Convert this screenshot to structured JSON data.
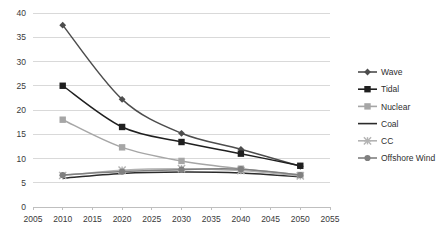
{
  "chart_data": {
    "type": "line",
    "title": "",
    "subtitle": "",
    "xlabel": "",
    "ylabel": "",
    "x": [
      2010,
      2020,
      2030,
      2040,
      2050
    ],
    "xlim": [
      2005,
      2055
    ],
    "ylim": [
      0,
      40
    ],
    "xticks": [
      "2005",
      "2010",
      "2015",
      "2020",
      "2025",
      "2030",
      "2035",
      "2040",
      "2045",
      "2050",
      "2055"
    ],
    "xtick_values": [
      2005,
      2010,
      2015,
      2020,
      2025,
      2030,
      2035,
      2040,
      2045,
      2050,
      2055
    ],
    "yticks": [
      "0",
      "5",
      "10",
      "15",
      "20",
      "25",
      "30",
      "35",
      "40"
    ],
    "ytick_values": [
      0,
      5,
      10,
      15,
      20,
      25,
      30,
      35,
      40
    ],
    "grid": "horizontal",
    "legend_position": "right",
    "series": [
      {
        "name": "Wave",
        "values": [
          37.5,
          22.2,
          15.2,
          11.9,
          8.4
        ],
        "color": "#4d4d4d",
        "marker": "diamond"
      },
      {
        "name": "Tidal",
        "values": [
          25.0,
          16.5,
          13.4,
          11.0,
          8.5
        ],
        "color": "#1f1f1f",
        "marker": "square"
      },
      {
        "name": "Nuclear",
        "values": [
          18.0,
          12.3,
          9.5,
          7.9,
          6.6
        ],
        "color": "#a6a6a6",
        "marker": "square"
      },
      {
        "name": "Coal",
        "values": [
          5.9,
          6.9,
          7.2,
          7.0,
          6.2
        ],
        "color": "#2b2b2b",
        "marker": "none"
      },
      {
        "name": "CC",
        "values": [
          6.5,
          7.6,
          7.9,
          7.5,
          6.4
        ],
        "color": "#b3b3b3",
        "marker": "cross"
      },
      {
        "name": "Offshore Wind",
        "values": [
          6.6,
          7.3,
          7.7,
          7.8,
          6.6
        ],
        "color": "#808080",
        "marker": "circle"
      }
    ]
  },
  "legend": {
    "items": [
      {
        "label": "Wave"
      },
      {
        "label": "Tidal"
      },
      {
        "label": "Nuclear"
      },
      {
        "label": "Coal"
      },
      {
        "label": "CC"
      },
      {
        "label": "Offshore Wind"
      }
    ]
  },
  "style": {
    "grid_color": "#d9d9d9",
    "axis_color": "#bfbfbf",
    "background": "#ffffff",
    "tick_text_color": "#3a3a3a"
  }
}
